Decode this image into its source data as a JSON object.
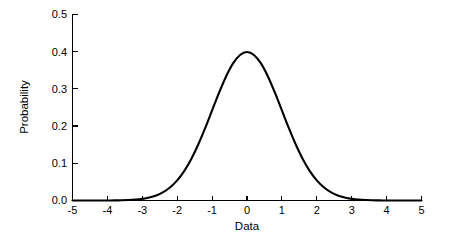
{
  "chart_data": {
    "type": "line",
    "title": "",
    "xlabel": "Data",
    "ylabel": "Probability",
    "xlim": [
      -5,
      5
    ],
    "ylim": [
      0.0,
      0.5
    ],
    "grid": false,
    "legend": null,
    "xticks": [
      -5,
      -4,
      -3,
      -2,
      -1,
      0,
      1,
      2,
      3,
      4,
      5
    ],
    "xtick_labels": [
      "-5",
      "-4",
      "-3",
      "-2",
      "-1",
      "0",
      "1",
      "2",
      "3",
      "4",
      "5"
    ],
    "yticks": [
      0.0,
      0.1,
      0.2,
      0.3,
      0.4,
      0.5
    ],
    "ytick_labels": [
      "0.0",
      "0.1",
      "0.2",
      "0.3",
      "0.4",
      "0.5"
    ],
    "series": [
      {
        "name": "Standard normal PDF",
        "color": "#000000",
        "x": [
          -5.0,
          -4.8,
          -4.6,
          -4.4,
          -4.2,
          -4.0,
          -3.8,
          -3.6,
          -3.4,
          -3.2,
          -3.0,
          -2.8,
          -2.6,
          -2.4,
          -2.2,
          -2.0,
          -1.8,
          -1.6,
          -1.4,
          -1.2,
          -1.0,
          -0.8,
          -0.6,
          -0.4,
          -0.2,
          0.0,
          0.2,
          0.4,
          0.6,
          0.8,
          1.0,
          1.2,
          1.4,
          1.6,
          1.8,
          2.0,
          2.2,
          2.4,
          2.6,
          2.8,
          3.0,
          3.2,
          3.4,
          3.6,
          3.8,
          4.0,
          4.2,
          4.4,
          4.6,
          4.8,
          5.0
        ],
        "y": [
          1.5e-06,
          4e-06,
          1.02e-05,
          2.49e-05,
          5.89e-05,
          0.0001338,
          0.0002919,
          0.0006119,
          0.0012322,
          0.0023841,
          0.0044318,
          0.0079155,
          0.013583,
          0.0223945,
          0.0354746,
          0.053991,
          0.0789502,
          0.1109208,
          0.1497275,
          0.1941861,
          0.2419707,
          0.2896916,
          0.3332246,
          0.3682701,
          0.3910427,
          0.3989423,
          0.3910427,
          0.3682701,
          0.3332246,
          0.2896916,
          0.2419707,
          0.1941861,
          0.1497275,
          0.1109208,
          0.0789502,
          0.053991,
          0.0354746,
          0.0223945,
          0.013583,
          0.0079155,
          0.0044318,
          0.0023841,
          0.0012322,
          0.0006119,
          0.0002919,
          0.0001338,
          5.89e-05,
          2.49e-05,
          1.02e-05,
          4e-06,
          1.5e-06
        ]
      }
    ],
    "peak": {
      "x": 0,
      "y": 0.4
    }
  },
  "axes": {
    "x_title": "Data",
    "y_title": "Probability"
  }
}
